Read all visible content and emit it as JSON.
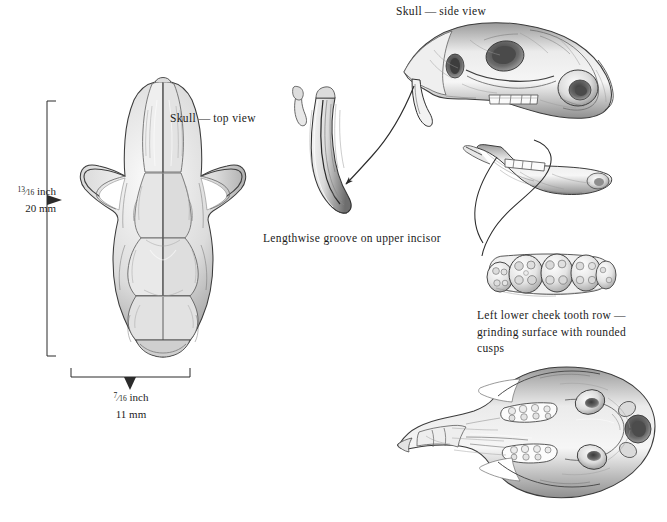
{
  "plate": {
    "title": "Skull identification plate",
    "subject": "rodent skull",
    "background_color": "#ffffff",
    "ink_color": "#1b1b1b"
  },
  "figures": [
    {
      "id": "skull-top-view",
      "name": "skull-top-view",
      "label": "Skull — top view",
      "label_x": 170,
      "label_y": 110
    },
    {
      "id": "skull-side-view",
      "name": "skull-side-view",
      "label": "Skull — side view",
      "label_x": 396,
      "label_y": 3
    },
    {
      "id": "upper-incisor-detail",
      "name": "upper-incisor-detail",
      "label": "Lengthwise groove on upper incisor",
      "label_x": 263,
      "label_y": 230
    },
    {
      "id": "lower-jaw-view",
      "name": "lower-jaw-view",
      "label": "",
      "label_x": 0,
      "label_y": 0
    },
    {
      "id": "cheek-tooth-row-detail",
      "name": "cheek-tooth-row-detail",
      "label_line1": "Left lower cheek tooth row —",
      "label_line2": "grinding surface with rounded cusps",
      "label_x": 477,
      "label_y": 307
    },
    {
      "id": "skull-bottom-view",
      "name": "skull-bottom-view",
      "label": "",
      "label_x": 0,
      "label_y": 0
    }
  ],
  "measurements": {
    "height": {
      "name": "skull-length-measurement",
      "inch_whole": "",
      "inch_numerator": "13",
      "inch_denominator": "16",
      "inch_unit": "inch",
      "metric": "20 mm",
      "x": 8,
      "y": 183
    },
    "width": {
      "name": "skull-width-measurement",
      "inch_numerator": "7",
      "inch_denominator": "16",
      "inch_unit": "inch",
      "metric": "11 mm",
      "x": 97,
      "y": 389
    }
  },
  "annotations": {
    "incisor_arrow": "curved-arrow-skull-to-incisor",
    "tooth_row_leader": "curved-leader-jaw-to-tooth-row",
    "groove_arrow": "arrow-pointing-to-groove"
  }
}
